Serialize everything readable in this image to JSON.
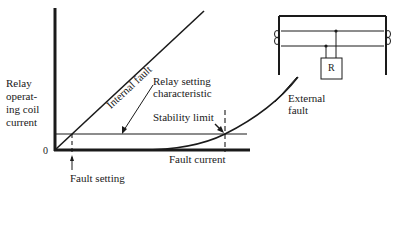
{
  "diagram": {
    "title": "",
    "y_axis_label": [
      "Relay",
      "operat-",
      "ing coil",
      "current"
    ],
    "x_axis_label": "Fault current",
    "origin_label": "0",
    "curves": {
      "internal_fault": "Internal fault",
      "external_fault": [
        "External",
        "fault"
      ],
      "relay_setting": [
        "Relay setting",
        "characteristic"
      ]
    },
    "annotations": {
      "stability_limit": "Stability limit",
      "fault_setting": "Fault setting"
    },
    "circuit": {
      "relay_label": "R"
    }
  },
  "colors": {
    "ink": "#1a1a1a",
    "background": "#ffffff"
  }
}
